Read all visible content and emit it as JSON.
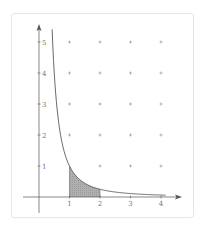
{
  "chart_data": {
    "type": "area",
    "title": "",
    "xlabel": "",
    "ylabel": "",
    "function": "y = 1/x^2",
    "curve": {
      "x_start": 0.43,
      "x_end": 4.15,
      "samples": [
        {
          "x": 0.43,
          "y": 5.41
        },
        {
          "x": 0.5,
          "y": 4.0
        },
        {
          "x": 0.6,
          "y": 2.78
        },
        {
          "x": 0.7,
          "y": 2.04
        },
        {
          "x": 0.8,
          "y": 1.56
        },
        {
          "x": 1.0,
          "y": 1.0
        },
        {
          "x": 1.5,
          "y": 0.44
        },
        {
          "x": 2.0,
          "y": 0.25
        },
        {
          "x": 3.0,
          "y": 0.11
        },
        {
          "x": 4.0,
          "y": 0.06
        }
      ]
    },
    "shaded_region": {
      "x_from": 1,
      "x_to": 2,
      "under": "curve",
      "color": "#a9a9a9"
    },
    "x_ticks": [
      "1",
      "2",
      "3",
      "4"
    ],
    "y_ticks": [
      "1",
      "2",
      "3",
      "4",
      "5"
    ],
    "xlim": [
      -0.5,
      4.6
    ],
    "ylim": [
      -0.5,
      5.6
    ],
    "grid": false,
    "grid_markers": {
      "symbol": "+",
      "points": [
        [
          1,
          5
        ],
        [
          2,
          5
        ],
        [
          3,
          5
        ],
        [
          4,
          5
        ],
        [
          1,
          4
        ],
        [
          2,
          4
        ],
        [
          3,
          4
        ],
        [
          4,
          4
        ],
        [
          1,
          3
        ],
        [
          2,
          3
        ],
        [
          3,
          3
        ],
        [
          4,
          3
        ],
        [
          1,
          2
        ],
        [
          2,
          2
        ],
        [
          3,
          2
        ],
        [
          4,
          2
        ],
        [
          2,
          1
        ],
        [
          3,
          1
        ],
        [
          4,
          1
        ]
      ]
    },
    "legend": null
  },
  "colors": {
    "axis": "#555555",
    "curve": "#444444",
    "marker": "#999999",
    "shade": "#a9a9a9",
    "card_border": "#e6e6e6"
  }
}
